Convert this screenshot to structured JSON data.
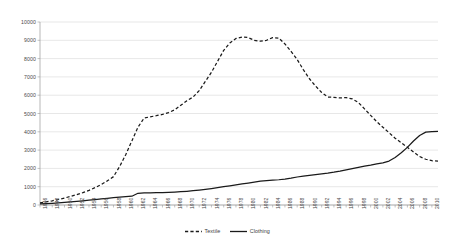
{
  "chart_data": {
    "type": "line",
    "title": "",
    "subtitle": "",
    "xlabel": "",
    "ylabel": "",
    "ylim": [
      0,
      10000
    ],
    "ytick_step": 1000,
    "yticks": [
      0,
      1000,
      2000,
      3000,
      4000,
      5000,
      6000,
      7000,
      8000,
      9000,
      10000
    ],
    "ytick_labels": [
      "0",
      "1000",
      "2000",
      "3000",
      "4000",
      "5000",
      "6000",
      "7000",
      "8000",
      "9000",
      "10000"
    ],
    "grid": true,
    "grid_axis": "y",
    "legend_position": "bottom-center",
    "x": [
      1946,
      1947,
      1948,
      1949,
      1950,
      1951,
      1952,
      1953,
      1954,
      1955,
      1956,
      1957,
      1958,
      1959,
      1960,
      1961,
      1962,
      1963,
      1964,
      1965,
      1966,
      1967,
      1968,
      1969,
      1970,
      1971,
      1972,
      1973,
      1974,
      1975,
      1976,
      1977,
      1978,
      1979,
      1980,
      1981,
      1982,
      1983,
      1984,
      1985,
      1986,
      1987,
      1988,
      1989,
      1990,
      1991,
      1992,
      1993,
      1994,
      1995,
      1996,
      1997,
      1998,
      1999,
      2000,
      2001,
      2002,
      2003,
      2004,
      2005,
      2006,
      2007,
      2008,
      2009,
      2010,
      2011
    ],
    "xtick_labels": [
      "1946",
      "1948",
      "1950",
      "1952",
      "1954",
      "1956",
      "1958",
      "1960",
      "1962",
      "1964",
      "1966",
      "1968",
      "1970",
      "1972",
      "1974",
      "1976",
      "1978",
      "1980",
      "1982",
      "1984",
      "1986",
      "1988",
      "1990",
      "1992",
      "1994",
      "1996",
      "1998",
      "2000",
      "2002",
      "2004",
      "2006",
      "2008",
      "2010"
    ],
    "series": [
      {
        "name": "Textile",
        "style": "dashed",
        "color": "#1a1a1a",
        "values": [
          120,
          170,
          230,
          300,
          380,
          470,
          570,
          680,
          800,
          950,
          1120,
          1320,
          1550,
          2100,
          2750,
          3500,
          4250,
          4750,
          4820,
          4880,
          4950,
          5050,
          5200,
          5450,
          5700,
          5900,
          6250,
          6750,
          7250,
          7850,
          8450,
          8850,
          9100,
          9180,
          9150,
          9000,
          8950,
          9000,
          9150,
          9120,
          8800,
          8400,
          7950,
          7400,
          6900,
          6500,
          6150,
          5900,
          5880,
          5850,
          5870,
          5800,
          5600,
          5250,
          4900,
          4550,
          4250,
          3950,
          3650,
          3400,
          3150,
          2900,
          2650,
          2500,
          2420,
          2400
        ]
      },
      {
        "name": "Clothing",
        "style": "solid",
        "color": "#1a1a1a",
        "values": [
          60,
          75,
          95,
          115,
          140,
          165,
          195,
          225,
          260,
          295,
          330,
          365,
          400,
          430,
          455,
          480,
          640,
          660,
          665,
          670,
          680,
          690,
          705,
          725,
          750,
          780,
          815,
          855,
          900,
          950,
          1000,
          1050,
          1100,
          1150,
          1200,
          1250,
          1300,
          1330,
          1360,
          1380,
          1420,
          1470,
          1530,
          1580,
          1620,
          1660,
          1700,
          1740,
          1790,
          1850,
          1920,
          1990,
          2060,
          2120,
          2180,
          2250,
          2300,
          2400,
          2600,
          2850,
          3150,
          3500,
          3800,
          3980,
          4010,
          4020
        ]
      }
    ]
  },
  "legend": {
    "items": [
      {
        "label": "Textile",
        "style": "dashed"
      },
      {
        "label": "Clothing",
        "style": "solid"
      }
    ]
  }
}
